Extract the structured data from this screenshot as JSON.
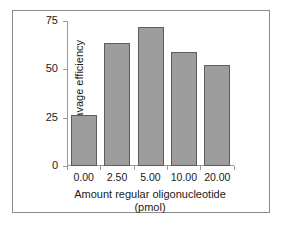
{
  "chart_data": {
    "type": "bar",
    "title": "",
    "subtitle": "",
    "xlabel": "Amount regular oligonucleotide",
    "xlabel_units": "(pmol)",
    "ylabel": "% Cleavage efficiency",
    "categories": [
      "0.00",
      "2.50",
      "5.00",
      "10.00",
      "20.00"
    ],
    "values": [
      26.5,
      63.5,
      72.0,
      59.0,
      52.5
    ],
    "ylim": [
      0,
      75
    ],
    "yticks": [
      0,
      25,
      50,
      75
    ],
    "ytick_labels": [
      "0",
      "25",
      "50",
      "75"
    ],
    "grid": false,
    "legend": null,
    "bar_color": "#9d9d9d",
    "bar_edge_color": "#5d5d5d",
    "axis_color": "#9a9a9a",
    "frame_color": "#8c8c8c",
    "text_color": "#1a1a1a"
  }
}
